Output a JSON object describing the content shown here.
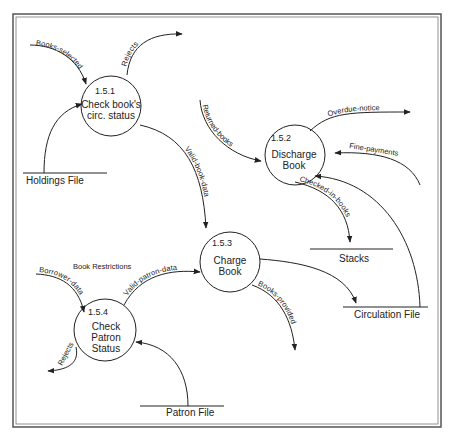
{
  "diagram": {
    "type": "data-flow-diagram",
    "processes": [
      {
        "id": "1.5.1",
        "line1": "Check book's",
        "line2": "circ. status",
        "line3": ""
      },
      {
        "id": "1.5.2",
        "line1": "Discharge",
        "line2": "Book",
        "line3": ""
      },
      {
        "id": "1.5.3",
        "line1": "Charge",
        "line2": "Book",
        "line3": ""
      },
      {
        "id": "1.5.4",
        "line1": "Check",
        "line2": "Patron",
        "line3": "Status"
      }
    ],
    "data_stores": [
      {
        "name": "Holdings File"
      },
      {
        "name": "Stacks"
      },
      {
        "name": "Circulation File"
      },
      {
        "name": "Patron File"
      }
    ],
    "flows": {
      "books_selected": "Books-selected",
      "rejects_1": "Rejects",
      "valid_book_data": "Valid-book-data",
      "returned_books": "Returned-books",
      "overdue_notice": "Overdue-notice",
      "fine_payments": "Fine-payments",
      "checked_in_books": "Checked-in-books",
      "borrower_data": "Borrower-data",
      "valid_patron_data": "Valid-patron-data",
      "books_provided": "Books-provided",
      "rejects_2": "Rejects"
    },
    "annotations": {
      "book_restrictions": "Book Restrictions"
    },
    "colors": {
      "ink": "#222222",
      "frame": "#555555",
      "background": "#ffffff"
    }
  }
}
